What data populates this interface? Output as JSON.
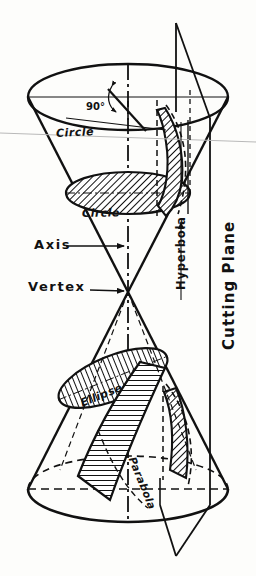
{
  "figure": {
    "background_color": "#fdfdfb",
    "line_color": "#111111",
    "labels": {
      "circle_top": "Circle",
      "circle_mid": "Circle",
      "ellipse": "Ellipse",
      "parabola": "Parabola",
      "hyperbola": "Hyperbola",
      "cutting_plane": "Cutting Plane",
      "axis": "Axis",
      "vertex": "Vertex",
      "right_angle": "90°"
    }
  },
  "geometry": {
    "upper_cone": {
      "rim_center_x": 128,
      "rim_center_y": 97,
      "rim_rx": 100,
      "rim_ry": 33,
      "apex_x": 128,
      "apex_y": 292
    },
    "lower_cone": {
      "base_center_x": 128,
      "base_center_y": 489,
      "base_rx": 100,
      "base_ry": 33,
      "apex_x": 128,
      "apex_y": 292
    },
    "mid_circle": {
      "center_x": 128,
      "center_y": 193,
      "rx": 62,
      "ry": 21
    },
    "ellipse_section": {
      "center_x": 113,
      "center_y": 378,
      "rx": 58,
      "ry": 22,
      "rotation_deg": -22
    },
    "cutting_plane": {
      "top_x": 176,
      "top_y": 23,
      "description": "vertical plane cutting parallel to the cone axis"
    }
  },
  "sections": [
    {
      "name": "Circle",
      "note": "plane perpendicular to axis, upper cone rim"
    },
    {
      "name": "Circle",
      "note": "plane perpendicular to axis, mid upper cone"
    },
    {
      "name": "Ellipse",
      "note": "plane oblique to axis, lower cone"
    },
    {
      "name": "Parabola",
      "note": "plane parallel to a cone element"
    },
    {
      "name": "Hyperbola",
      "note": "plane parallel to the axis"
    }
  ]
}
